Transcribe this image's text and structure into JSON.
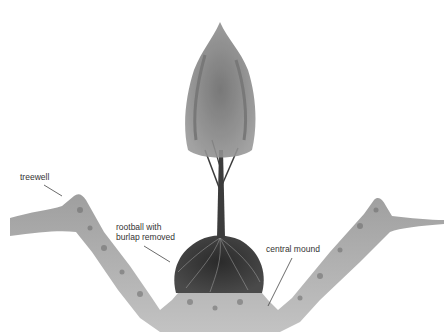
{
  "diagram": {
    "labels": [
      {
        "id": "treewell",
        "text": "treewell"
      },
      {
        "id": "rootball",
        "line1": "rootball with",
        "line2": "burlap removed"
      },
      {
        "id": "central-mound",
        "text": "central mound"
      }
    ],
    "colors": {
      "soil": "#8a8a8a",
      "soil_dark": "#6e6e6e",
      "rootball": "#3a3a3a",
      "foliage": "#7d7d7d",
      "trunk": "#3c3c3c",
      "leader_line": "#444444"
    }
  }
}
